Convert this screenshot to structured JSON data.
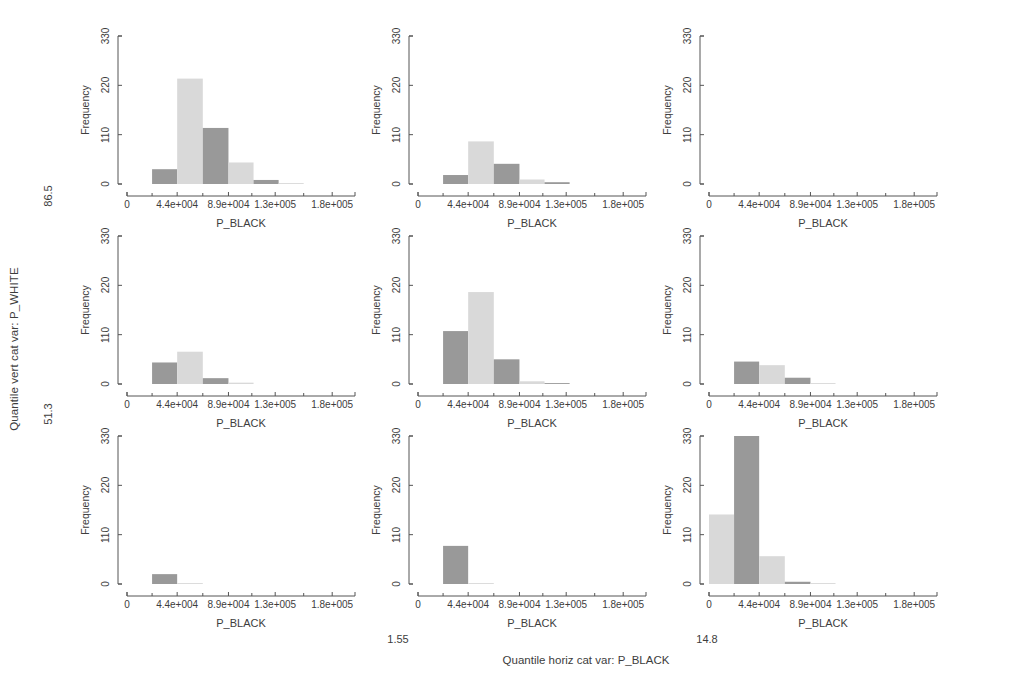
{
  "figure": {
    "outer_vertical_axis_label": "Quantile vert cat var: P_WHITE",
    "outer_vertical_ticks": [
      "86.5",
      "51.3"
    ],
    "outer_horizontal_axis_label": "Quantile horiz cat var: P_BLACK",
    "outer_horizontal_ticks": [
      "1.55",
      "14.8"
    ],
    "panel_x_axis_title": "P_BLACK",
    "panel_y_axis_title": "Frequency",
    "y_tick_labels": [
      "0",
      "110",
      "220",
      "330"
    ],
    "y_tick_values": [
      0,
      110,
      220,
      330
    ],
    "x_tick_labels": [
      "0",
      "4.4e+004",
      "8.9e+004",
      "1.3e+005",
      "1.8e+005"
    ],
    "x_tick_values": [
      0,
      44000,
      89000,
      130000,
      180000
    ],
    "colors": {
      "bar_dark": "#999999",
      "bar_light": "#d9d9d9",
      "axis": "#555555",
      "text": "#3d3d3d",
      "background": "#ffffff"
    }
  },
  "chart_data": {
    "type": "bar",
    "title": "",
    "subtitle": "",
    "xlabel": "P_BLACK",
    "ylabel": "Frequency",
    "xlim": [
      0,
      200000
    ],
    "ylim": [
      0,
      330
    ],
    "grid": false,
    "legend": "none",
    "layout": {
      "rows": 3,
      "cols": 3
    },
    "row_labels": [
      "86.5",
      "",
      "51.3"
    ],
    "col_labels": [
      "1.55",
      "",
      "14.8"
    ],
    "bin_width": 22000,
    "bin_edges": [
      0,
      22000,
      44000,
      66500,
      89000,
      111000,
      130000,
      155000,
      180000
    ],
    "panels": [
      {
        "row": 0,
        "col": 0,
        "id": "panel-r1c1",
        "bins": [
          {
            "x0": 22000,
            "x1": 44000,
            "value": 33,
            "shade": "dark"
          },
          {
            "x0": 44000,
            "x1": 66500,
            "value": 235,
            "shade": "light"
          },
          {
            "x0": 66500,
            "x1": 89000,
            "value": 125,
            "shade": "dark"
          },
          {
            "x0": 89000,
            "x1": 111000,
            "value": 48,
            "shade": "light"
          },
          {
            "x0": 111000,
            "x1": 133000,
            "value": 9,
            "shade": "dark"
          },
          {
            "x0": 133000,
            "x1": 155000,
            "value": 2,
            "shade": "light"
          }
        ]
      },
      {
        "row": 0,
        "col": 1,
        "id": "panel-r1c2",
        "bins": [
          {
            "x0": 22000,
            "x1": 44000,
            "value": 20,
            "shade": "dark"
          },
          {
            "x0": 44000,
            "x1": 66500,
            "value": 95,
            "shade": "light"
          },
          {
            "x0": 66500,
            "x1": 89000,
            "value": 45,
            "shade": "dark"
          },
          {
            "x0": 89000,
            "x1": 111000,
            "value": 10,
            "shade": "light"
          },
          {
            "x0": 111000,
            "x1": 133000,
            "value": 4,
            "shade": "dark"
          }
        ]
      },
      {
        "row": 0,
        "col": 2,
        "id": "panel-r1c3",
        "bins": []
      },
      {
        "row": 1,
        "col": 0,
        "id": "panel-r2c1",
        "bins": [
          {
            "x0": 22000,
            "x1": 44000,
            "value": 48,
            "shade": "dark"
          },
          {
            "x0": 44000,
            "x1": 66500,
            "value": 72,
            "shade": "light"
          },
          {
            "x0": 66500,
            "x1": 89000,
            "value": 13,
            "shade": "dark"
          },
          {
            "x0": 89000,
            "x1": 111000,
            "value": 3,
            "shade": "light"
          }
        ]
      },
      {
        "row": 1,
        "col": 1,
        "id": "panel-r2c2",
        "bins": [
          {
            "x0": 22000,
            "x1": 44000,
            "value": 118,
            "shade": "dark"
          },
          {
            "x0": 44000,
            "x1": 66500,
            "value": 205,
            "shade": "light"
          },
          {
            "x0": 66500,
            "x1": 89000,
            "value": 55,
            "shade": "dark"
          },
          {
            "x0": 89000,
            "x1": 111000,
            "value": 6,
            "shade": "light"
          },
          {
            "x0": 111000,
            "x1": 133000,
            "value": 2,
            "shade": "dark"
          }
        ]
      },
      {
        "row": 1,
        "col": 2,
        "id": "panel-r2c3",
        "bins": [
          {
            "x0": 22000,
            "x1": 44000,
            "value": 50,
            "shade": "dark"
          },
          {
            "x0": 44000,
            "x1": 66500,
            "value": 42,
            "shade": "light"
          },
          {
            "x0": 66500,
            "x1": 89000,
            "value": 14,
            "shade": "dark"
          },
          {
            "x0": 89000,
            "x1": 111000,
            "value": 2,
            "shade": "light"
          }
        ]
      },
      {
        "row": 2,
        "col": 0,
        "id": "panel-r3c1",
        "bins": [
          {
            "x0": 22000,
            "x1": 44000,
            "value": 22,
            "shade": "dark"
          },
          {
            "x0": 44000,
            "x1": 66500,
            "value": 2,
            "shade": "light"
          }
        ]
      },
      {
        "row": 2,
        "col": 1,
        "id": "panel-r3c2",
        "bins": [
          {
            "x0": 22000,
            "x1": 44000,
            "value": 85,
            "shade": "dark"
          },
          {
            "x0": 44000,
            "x1": 66500,
            "value": 2,
            "shade": "light"
          }
        ]
      },
      {
        "row": 2,
        "col": 2,
        "id": "panel-r3c3",
        "bins": [
          {
            "x0": 0,
            "x1": 22000,
            "value": 155,
            "shade": "light"
          },
          {
            "x0": 22000,
            "x1": 44000,
            "value": 330,
            "shade": "dark"
          },
          {
            "x0": 44000,
            "x1": 66500,
            "value": 62,
            "shade": "light"
          },
          {
            "x0": 66500,
            "x1": 89000,
            "value": 5,
            "shade": "dark"
          },
          {
            "x0": 89000,
            "x1": 111000,
            "value": 2,
            "shade": "light"
          }
        ]
      }
    ]
  }
}
